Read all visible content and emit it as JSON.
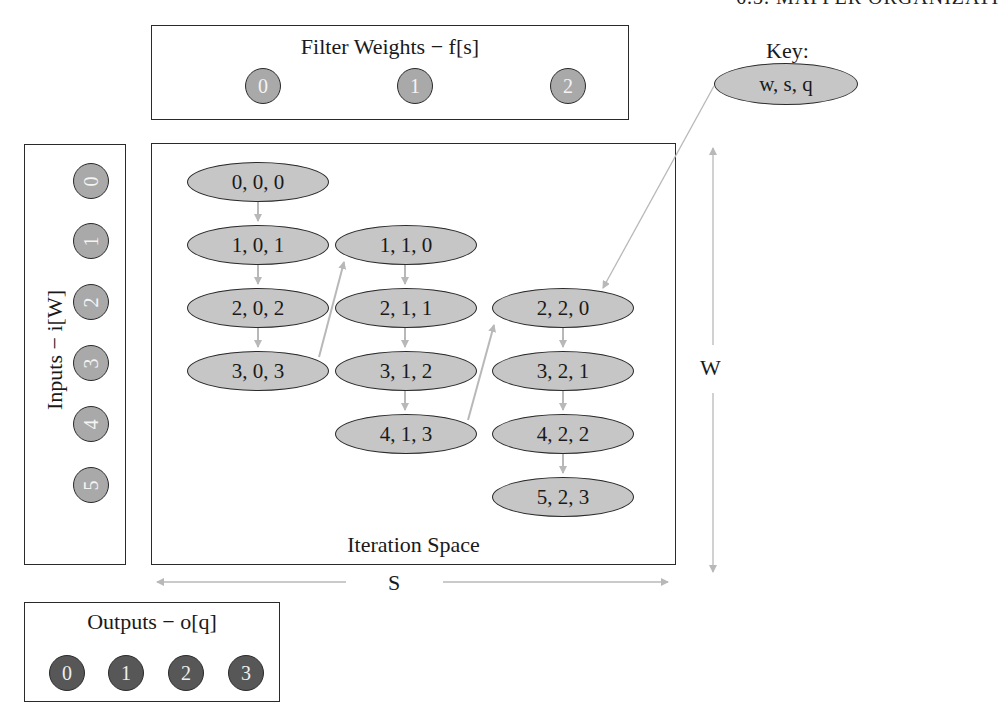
{
  "header": {
    "text": "6.3. MAPPER ORGANIZATI"
  },
  "filter_weights": {
    "title": "Filter Weights − f[s]",
    "items": [
      "0",
      "1",
      "2"
    ]
  },
  "key": {
    "title": "Key:",
    "node_label": "w, s, q"
  },
  "inputs": {
    "title": "Inputs − i[W]",
    "items": [
      "0",
      "1",
      "2",
      "3",
      "4",
      "5"
    ]
  },
  "outputs": {
    "title": "Outputs − o[q]",
    "items": [
      "0",
      "1",
      "2",
      "3"
    ]
  },
  "iteration_space": {
    "title": "Iteration Space",
    "columns": [
      {
        "s": 0,
        "nodes": [
          "0, 0, 0",
          "1, 0, 1",
          "2, 0, 2",
          "3, 0, 3"
        ]
      },
      {
        "s": 1,
        "nodes": [
          "1, 1, 0",
          "2, 1, 1",
          "3, 1, 2",
          "4, 1, 3"
        ]
      },
      {
        "s": 2,
        "nodes": [
          "2, 2, 0",
          "3, 2, 1",
          "4, 2, 2",
          "5, 2, 3"
        ]
      }
    ]
  },
  "axes": {
    "horizontal_label": "S",
    "vertical_label": "W"
  },
  "colors": {
    "node_fill": "#c6c6c6",
    "input_weight_fill": "#a9a9a9",
    "output_fill": "#575757",
    "arrow": "#b8b8b8",
    "border": "#2a2a2a"
  }
}
